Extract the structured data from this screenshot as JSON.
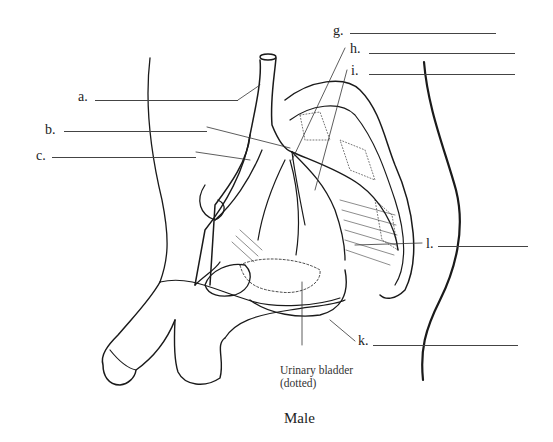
{
  "diagram": {
    "title": "Male",
    "labels": [
      {
        "id": "a",
        "text": "a.",
        "x": 78,
        "y": 90,
        "blank_x1": 95,
        "blank_x2": 238,
        "blank_y": 100
      },
      {
        "id": "b",
        "text": "b.",
        "x": 45,
        "y": 123,
        "blank_x1": 64,
        "blank_x2": 207,
        "blank_y": 131
      },
      {
        "id": "c",
        "text": "c.",
        "x": 36,
        "y": 149,
        "blank_x1": 52,
        "blank_x2": 196,
        "blank_y": 157
      },
      {
        "id": "g",
        "text": "g.",
        "x": 333,
        "y": 24,
        "blank_x1": 350,
        "blank_x2": 496,
        "blank_y": 33
      },
      {
        "id": "h",
        "text": "h.",
        "x": 350,
        "y": 42,
        "blank_x1": 369,
        "blank_x2": 515,
        "blank_y": 53
      },
      {
        "id": "i",
        "text": "i.",
        "x": 351,
        "y": 64,
        "blank_x1": 369,
        "blank_x2": 515,
        "blank_y": 74
      },
      {
        "id": "l",
        "text": "l.",
        "x": 426,
        "y": 237,
        "blank_x1": 438,
        "blank_x2": 528,
        "blank_y": 246
      },
      {
        "id": "k",
        "text": "k.",
        "x": 358,
        "y": 334,
        "blank_x1": 373,
        "blank_x2": 518,
        "blank_y": 345
      }
    ],
    "caption_line1": "Urinary bladder",
    "caption_line2": "(dotted)"
  }
}
